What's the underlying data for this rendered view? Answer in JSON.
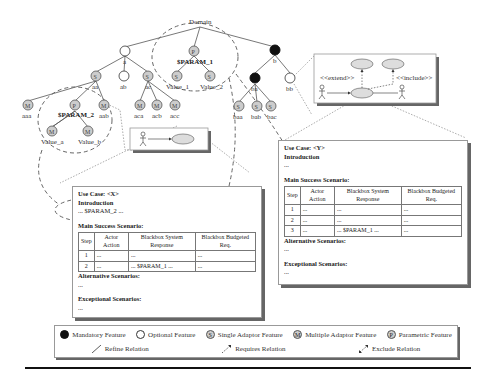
{
  "feature_model": {
    "root": "Domain",
    "nodes": {
      "a": "a",
      "b": "b",
      "aa": "aa",
      "ab": "ab",
      "ac": "ac",
      "aaa": "aaa",
      "aab": "aab",
      "aca": "aca",
      "acb": "acb",
      "acc": "acc",
      "ba": "ba",
      "bb": "bb",
      "baa": "baa",
      "bab": "bab",
      "bac": "bac"
    },
    "param1": {
      "name": "$PARAM_1",
      "values": [
        "Value_1",
        "Value_2"
      ]
    },
    "param2": {
      "name": "$PARAM_2",
      "values": [
        "Value_a",
        "Value_b"
      ]
    }
  },
  "uc_diagram_large": {
    "extend": "<<extend>>",
    "include": "<<include>>"
  },
  "use_case_x": {
    "title": "Use Case: <X>",
    "intro_label": "Introduction",
    "intro_text": "... $PARAM_2 ...",
    "main_label": "Main Success Scenario:",
    "headers": [
      "Step",
      "Actor Action",
      "Blackbox System Response",
      "Blackbox Budgeted Req."
    ],
    "rows": [
      [
        "1",
        "...",
        "...",
        "..."
      ],
      [
        "2",
        "...",
        "... $PARAM_1 ...",
        "..."
      ]
    ],
    "alt_label": "Alternative Scenarios:",
    "alt_text": "...",
    "exc_label": "Exceptional Scenarios:",
    "exc_text": "..."
  },
  "use_case_y": {
    "title": "Use Case: <Y>",
    "intro_label": "Introduction",
    "intro_text": "...",
    "main_label": "Main Success Scenario:",
    "headers": [
      "Step",
      "Actor Action",
      "Blackbox System Response",
      "Blackbox Budgeted Req."
    ],
    "rows": [
      [
        "1",
        "...",
        "...",
        "..."
      ],
      [
        "2",
        "...",
        "...",
        "..."
      ],
      [
        "3",
        "...",
        "... $PARAM_1 ...",
        "..."
      ]
    ],
    "alt_label": "Alternative Scenarios:",
    "alt_text": "...",
    "exc_label": "Exceptional Scenarios:",
    "exc_text": "..."
  },
  "legend": {
    "mandatory": "Mandatory Feature",
    "optional": "Optional Feature",
    "single": "Single Adaptor Feature",
    "multiple": "Multiple Adaptor Feature",
    "parametric": "Parametric Feature",
    "refine": "Refine Relation",
    "requires": "Requires Relation",
    "exclude": "Exclude Relation",
    "glyph_single": "S",
    "glyph_multi": "M",
    "glyph_param": "P"
  },
  "colors": {
    "node_fill": "#cccccc",
    "mandatory": "#111111",
    "stroke": "#555555"
  }
}
